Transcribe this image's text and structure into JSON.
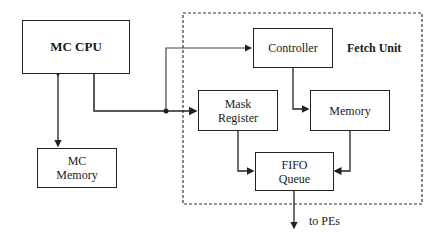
{
  "diagram": {
    "nodes": {
      "mc_cpu": {
        "label": "MC CPU"
      },
      "mc_memory": {
        "line1": "MC",
        "line2": "Memory"
      },
      "controller": {
        "label": "Controller"
      },
      "mask_register": {
        "line1": "Mask",
        "line2": "Register"
      },
      "memory": {
        "label": "Memory"
      },
      "fifo_queue": {
        "line1": "FIFO",
        "line2": "Queue"
      }
    },
    "group": {
      "label": "Fetch Unit"
    },
    "output_label": "to PEs",
    "edges": [
      {
        "from": "MC CPU",
        "to": "MC Memory",
        "bidirectional": true
      },
      {
        "from": "MC CPU",
        "to": "Controller"
      },
      {
        "from": "MC CPU",
        "to": "Mask Register"
      },
      {
        "from": "Controller",
        "to": "Memory"
      },
      {
        "from": "Mask Register",
        "to": "FIFO Queue"
      },
      {
        "from": "Memory",
        "to": "FIFO Queue"
      },
      {
        "from": "FIFO Queue",
        "to": "to PEs"
      }
    ]
  }
}
